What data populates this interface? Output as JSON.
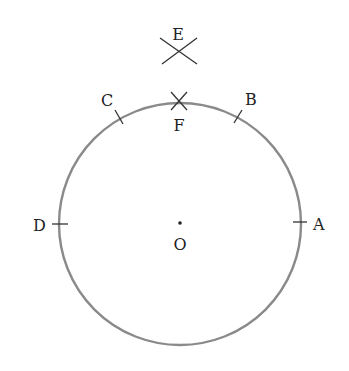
{
  "diagram": {
    "type": "geometric-construction",
    "colors": {
      "circle": "#8a8a8a",
      "marks": "#333333",
      "labels": "#222222",
      "background": "#ffffff"
    },
    "circle": {
      "center_label": "O",
      "cx": 180,
      "cy": 224,
      "r": 121
    },
    "points": [
      {
        "id": "A",
        "label": "A",
        "mark": "tick"
      },
      {
        "id": "B",
        "label": "B",
        "mark": "tick"
      },
      {
        "id": "C",
        "label": "C",
        "mark": "tick"
      },
      {
        "id": "D",
        "label": "D",
        "mark": "tick"
      },
      {
        "id": "E",
        "label": "E",
        "mark": "arc-cross"
      },
      {
        "id": "F",
        "label": "F",
        "mark": "arc-cross"
      },
      {
        "id": "O",
        "label": "O",
        "mark": "dot"
      }
    ]
  }
}
